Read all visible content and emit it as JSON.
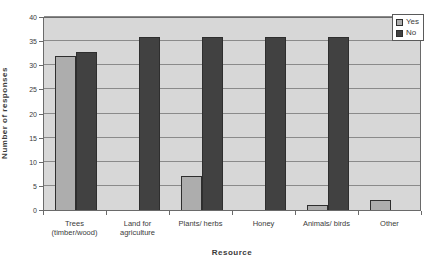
{
  "chart_data": {
    "type": "bar",
    "title": "",
    "xlabel": "Resource",
    "ylabel": "Number of responses",
    "categories": [
      "Trees (timber/wood)",
      "Land for agriculture",
      "Plants/ herbs",
      "Honey",
      "Animals/ birds",
      "Other"
    ],
    "category_label_lines": [
      [
        "Trees",
        "(timber/wood)"
      ],
      [
        "Land for",
        "agriculture"
      ],
      [
        "Plants/ herbs"
      ],
      [
        "Honey"
      ],
      [
        "Animals/ birds"
      ],
      [
        "Other"
      ]
    ],
    "series": [
      {
        "name": "Yes",
        "color": "#adadad",
        "values": [
          32,
          0,
          7,
          0,
          1,
          2
        ]
      },
      {
        "name": "No",
        "color": "#414141",
        "values": [
          33,
          36,
          36,
          36,
          36,
          0
        ]
      }
    ],
    "ylim": [
      0,
      40
    ],
    "yticks": [
      0,
      5,
      10,
      15,
      20,
      25,
      30,
      35,
      40
    ],
    "grid": true,
    "legend_position": "top-right",
    "plot_background": "#d7d7d7",
    "gridline_color": "#8a8a8a"
  }
}
